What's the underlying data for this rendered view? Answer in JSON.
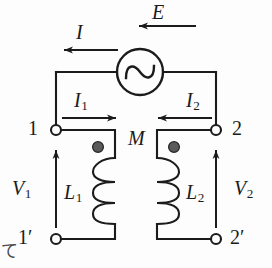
{
  "figure": {
    "kind": "circuit-diagram",
    "width": 272,
    "height": 268,
    "background_color": "#fdfdfd",
    "ink_color": "#1b1b1b",
    "dot_color": "#555555"
  },
  "source": {
    "name": "ac-voltage-source",
    "symbol": "circle-with-sine",
    "label": "E",
    "center_x": 140,
    "center_y": 72,
    "radius": 23
  },
  "currents": {
    "total": {
      "label": "I",
      "direction": "left",
      "arrow_y": 50,
      "arrow_from_x": 118,
      "arrow_to_x": 62,
      "label_x": 76,
      "label_y": 22
    },
    "source": {
      "label": "E",
      "direction": "left",
      "arrow_y": 26,
      "arrow_from_x": 196,
      "arrow_to_x": 136,
      "label_x": 152,
      "label_y": 2
    },
    "primary": {
      "label": "I",
      "subscript": "1",
      "direction": "right",
      "arrow_y": 118,
      "arrow_from_x": 62,
      "arrow_to_x": 118,
      "label_x": 76,
      "label_y": 90
    },
    "secondary": {
      "label": "I",
      "subscript": "2",
      "direction": "left",
      "arrow_y": 118,
      "arrow_from_x": 212,
      "arrow_to_x": 156,
      "label_x": 188,
      "label_y": 90
    }
  },
  "terminals": [
    {
      "name": "terminal-1",
      "label": "1",
      "prime": false,
      "x": 56,
      "y": 130,
      "label_x": 28,
      "label_y": 118
    },
    {
      "name": "terminal-1p",
      "label": "1",
      "prime": true,
      "x": 56,
      "y": 239,
      "label_x": 22,
      "label_y": 227
    },
    {
      "name": "terminal-2",
      "label": "2",
      "prime": false,
      "x": 216,
      "y": 130,
      "label_x": 232,
      "label_y": 118
    },
    {
      "name": "terminal-2p",
      "label": "2",
      "prime": true,
      "x": 216,
      "y": 239,
      "label_x": 232,
      "label_y": 227
    }
  ],
  "voltages": {
    "primary": {
      "label": "V",
      "subscript": "1",
      "arrow_x": 56,
      "arrow_from_y": 228,
      "arrow_to_y": 148,
      "direction": "up",
      "label_x": 14,
      "label_y": 178
    },
    "secondary": {
      "label": "V",
      "subscript": "2",
      "arrow_x": 216,
      "arrow_from_y": 228,
      "arrow_to_y": 148,
      "direction": "up",
      "label_x": 236,
      "label_y": 178
    }
  },
  "inductors": {
    "primary": {
      "name": "inductor-L1",
      "label": "L",
      "subscript": "1",
      "label_x": 66,
      "label_y": 182,
      "axis_x": 115,
      "turns": 3,
      "bulge": "left",
      "dot_x": 98,
      "dot_y": 147
    },
    "secondary": {
      "name": "inductor-L2",
      "label": "L",
      "subscript": "2",
      "label_x": 186,
      "label_y": 182,
      "axis_x": 157,
      "turns": 3,
      "bulge": "right",
      "dot_x": 174,
      "dot_y": 147
    },
    "mutual": {
      "label": "M",
      "label_x": 130,
      "label_y": 130
    }
  },
  "artifact": {
    "glyph": "て",
    "x": 2,
    "y": 244
  }
}
